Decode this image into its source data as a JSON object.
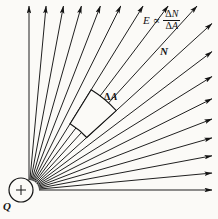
{
  "figure": {
    "background_color": "#fbfaf7",
    "ink_color": "#141414",
    "width": 218,
    "height": 219
  },
  "labels": {
    "formula_E": "E",
    "formula_proportional": "∝",
    "formula_numerator_delta": "Δ",
    "formula_numerator_var": "N",
    "formula_denominator_delta": "Δ",
    "formula_denominator_var": "A",
    "field_lines_N": "N",
    "charge_Q": "Q",
    "charge_polarity": "+",
    "area_patch_delta": "Δ",
    "area_patch_var": "A"
  },
  "chart_data": {
    "type": "diagram",
    "origin": {
      "x": 29,
      "y": 190
    },
    "charge": {
      "label": "Q",
      "sign": "+",
      "center_x": 21,
      "center_y": 190,
      "radius": 12,
      "polarity": "positive"
    },
    "rays": {
      "count": 18,
      "angle_start_deg": 90,
      "angle_end_deg": 0,
      "note": "Arrow-tipped straight rays fanning from the charge through the first quadrant, evenly spaced in angle.",
      "angles_deg": [
        90,
        84.7,
        79.4,
        74.1,
        68.8,
        63.5,
        58.2,
        52.9,
        47.6,
        42.3,
        37.1,
        31.8,
        26.5,
        21.2,
        15.9,
        10.6,
        5.3,
        0
      ],
      "arrow_head_length": 7,
      "arrow_head_width": 3
    },
    "area_element": {
      "label": "ΔA",
      "label_x": 104,
      "label_y": 92,
      "shape": "curved quadrilateral patch normal to the field lines",
      "inner_radius": 78,
      "outer_radius": 118,
      "angle_low_deg": 42.3,
      "angle_high_deg": 58.2
    },
    "annotations": [
      {
        "text": "E ∝ ΔN/ΔA",
        "x": 143,
        "y": 9
      },
      {
        "text": "N",
        "x": 160,
        "y": 46
      },
      {
        "text": "ΔA",
        "x": 104,
        "y": 92
      },
      {
        "text": "Q",
        "x": 3,
        "y": 201
      }
    ]
  }
}
